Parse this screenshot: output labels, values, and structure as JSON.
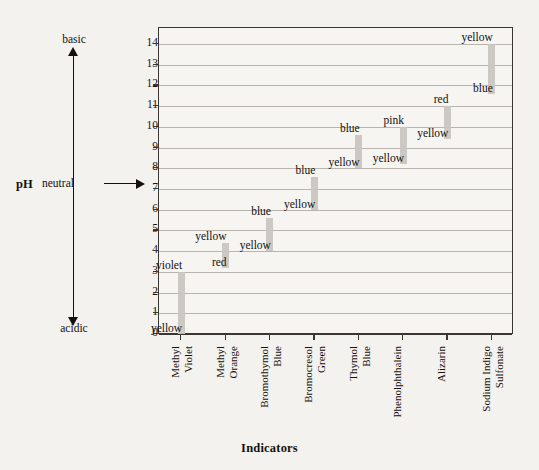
{
  "chart_data": {
    "type": "bar",
    "title": "",
    "xlabel": "Indicators",
    "ylabel": "pH",
    "ylim": [
      0,
      14
    ],
    "grid": true,
    "legend": "none",
    "yticks": [
      14,
      13,
      12,
      11,
      10,
      9,
      8,
      7,
      6,
      5,
      4,
      3,
      2,
      1,
      0
    ],
    "categories": [
      "Methyl Violet",
      "Methyl Orange",
      "Bromothymol Blue",
      "Bromocresol Green",
      "Thymol Blue",
      "Phenolphthalein",
      "Alizarin",
      "Sodium Indigo Sulfonate"
    ],
    "series": [
      {
        "name": "pH transition range",
        "ranges": [
          {
            "indicator": "Methyl Violet",
            "low": 0.0,
            "high": 3.0,
            "low_color": "yellow",
            "high_color": "violet"
          },
          {
            "indicator": "Methyl Orange",
            "low": 3.2,
            "high": 4.4,
            "low_color": "red",
            "high_color": "yellow"
          },
          {
            "indicator": "Bromothymol Blue",
            "low": 4.0,
            "high": 5.6,
            "low_color": "yellow",
            "high_color": "blue"
          },
          {
            "indicator": "Bromocresol Green",
            "low": 6.0,
            "high": 7.6,
            "low_color": "yellow",
            "high_color": "blue"
          },
          {
            "indicator": "Thymol Blue",
            "low": 8.0,
            "high": 9.6,
            "low_color": "yellow",
            "high_color": "blue"
          },
          {
            "indicator": "Phenolphthalein",
            "low": 8.2,
            "high": 10.0,
            "low_color": "yellow",
            "high_color": "pink"
          },
          {
            "indicator": "Alizarin",
            "low": 9.4,
            "high": 11.0,
            "low_color": "yellow",
            "high_color": "red"
          },
          {
            "indicator": "Sodium Indigo Sulfonate",
            "low": 11.6,
            "high": 14.0,
            "low_color": "blue",
            "high_color": "yellow"
          }
        ]
      }
    ],
    "bar_color": "#c9c6c1",
    "grid_color": "#b9b5ae",
    "axis_color": "#3a3632",
    "background": "#f4f2ee"
  },
  "ph_scale": {
    "axis_label": "pH",
    "top_word": "basic",
    "middle_word": "neutral",
    "bottom_word": "acidic",
    "neutral_value": 7
  },
  "axis_titles": {
    "x": "Indicators"
  },
  "x_labels": [
    {
      "line1": "Methyl",
      "line2": "Violet"
    },
    {
      "line1": "Methyl",
      "line2": "Orange"
    },
    {
      "line1": "Bromothymol",
      "line2": "Blue"
    },
    {
      "line1": "Bromocresol",
      "line2": "Green"
    },
    {
      "line1": "Thymol",
      "line2": "Blue"
    },
    {
      "line1": "Phenolphthalein",
      "line2": ""
    },
    {
      "line1": "Alizarin",
      "line2": ""
    },
    {
      "line1": "Sodium Indigo",
      "line2": "Sulfonate"
    }
  ]
}
